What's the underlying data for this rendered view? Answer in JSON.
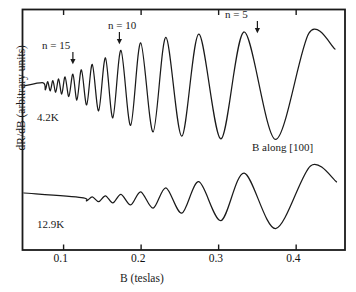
{
  "figure": {
    "xlabel": "B (teslas)",
    "ylabel": "dR/dB (arbitrary units)",
    "annotations": {
      "n15": "n = 15",
      "n10": "n = 10",
      "n5": "n = 5",
      "temp_upper": "4.2K",
      "temp_lower": "12.9K",
      "orientation": "B along [100]"
    },
    "axis_color": "#1a1a1a",
    "curve_color": "#1a1a1a",
    "background": "#ffffff"
  },
  "chart_data": {
    "type": "line",
    "title": "",
    "xlabel": "B (teslas)",
    "ylabel": "dR/dB (arbitrary units)",
    "xlim": [
      0.047,
      0.463
    ],
    "ylim": [
      0,
      1
    ],
    "grid": false,
    "legend": "none",
    "xticks": [
      0.1,
      0.2,
      0.3,
      0.4
    ],
    "xticklabels": [
      "0.1",
      "0.2",
      "0.3",
      "0.4"
    ],
    "yticks": [],
    "yticklabels": [],
    "tick_direction": "in",
    "ticks_on": [
      "top",
      "bottom"
    ],
    "annotations": [
      {
        "text": "n = 15",
        "x": 0.112,
        "arrow": true,
        "marks": "landau-level-15"
      },
      {
        "text": "n = 10",
        "x": 0.172,
        "arrow": true,
        "marks": "landau-level-10"
      },
      {
        "text": "n = 5",
        "x": 0.35,
        "arrow": true,
        "marks": "landau-level-5"
      },
      {
        "text": "4.2K",
        "x": 0.066,
        "series": "4.2K"
      },
      {
        "text": "12.9K",
        "x": 0.066,
        "series": "12.9K"
      },
      {
        "text": "B along [100]",
        "x": 0.34
      }
    ],
    "series": [
      {
        "name": "4.2K",
        "comment": "Shubnikov-de Haas oscillations of dR/dB; amplitude and period grow with B",
        "peaks_B": [
          0.0735,
          0.0795,
          0.0862,
          0.0936,
          0.1019,
          0.112,
          0.123,
          0.137,
          0.154,
          0.174,
          0.1995,
          0.232,
          0.2745,
          0.333,
          0.4165
        ],
        "valleys_B": [
          0.0765,
          0.0828,
          0.0898,
          0.0976,
          0.1068,
          0.1172,
          0.1298,
          0.1452,
          0.1635,
          0.1865,
          0.2155,
          0.2525,
          0.303,
          0.3735
        ],
        "peak_amplitude": [
          0.06,
          0.08,
          0.1,
          0.13,
          0.17,
          0.22,
          0.3,
          0.4,
          0.52,
          0.66,
          0.8,
          0.9,
          0.96,
          1.0,
          0.98
        ],
        "baseline": 0.52
      },
      {
        "name": "12.9K",
        "comment": "same oscillations strongly damped by temperature; flat below ~0.12 T",
        "peaks_B": [
          0.123,
          0.137,
          0.154,
          0.174,
          0.1995,
          0.232,
          0.2745,
          0.333,
          0.4185
        ],
        "valleys_B": [
          0.1298,
          0.1452,
          0.1635,
          0.1865,
          0.2155,
          0.2525,
          0.303,
          0.3735
        ],
        "peak_amplitude": [
          0.04,
          0.06,
          0.09,
          0.13,
          0.2,
          0.31,
          0.48,
          0.72,
          0.92
        ],
        "baseline": 0.2
      }
    ]
  }
}
